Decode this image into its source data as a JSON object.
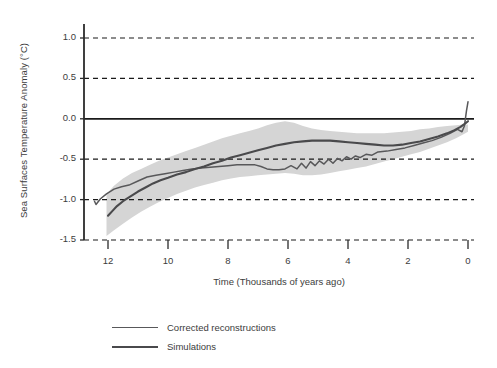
{
  "chart_data": {
    "type": "line",
    "title": "",
    "xlabel": "Time (Thousands of years ago)",
    "ylabel": "Sea Surfaces Temperature Anomaly (°C)",
    "xlim": [
      12.8,
      -0.2
    ],
    "ylim": [
      -1.5,
      1.0
    ],
    "x_reversed": true,
    "grid": "horizontal-dashed",
    "zero_line": true,
    "legend_position": "below-plot-left",
    "xticks": [
      12,
      10,
      8,
      6,
      4,
      2,
      0
    ],
    "xtick_labels": [
      "12",
      "10",
      "8",
      "6",
      "4",
      "2",
      "0"
    ],
    "yticks": [
      1.0,
      0.5,
      0.0,
      -0.5,
      -1.0,
      -1.5
    ],
    "ytick_labels": [
      "1.0",
      "0.5",
      "0.0",
      "-0.5",
      "-1.0",
      "-1.5"
    ],
    "colors": {
      "reconstructions_line": "#58585a",
      "simulations_line": "#4a4a4c",
      "uncertainty_band": "#d5d5d5",
      "axis": "#2b2b2b",
      "grid": "#1a1a1a",
      "background": "#ffffff"
    },
    "series": [
      {
        "name": "Corrected reconstructions",
        "style": "solid",
        "x": [
          12.45,
          12.4,
          12.25,
          12.05,
          11.8,
          11.55,
          11.3,
          11.0,
          10.7,
          10.4,
          10.1,
          9.8,
          9.5,
          9.2,
          8.9,
          8.6,
          8.3,
          8.0,
          7.7,
          7.4,
          7.1,
          6.9,
          6.7,
          6.5,
          6.3,
          6.1,
          5.9,
          5.7,
          5.55,
          5.4,
          5.25,
          5.1,
          4.95,
          4.8,
          4.65,
          4.5,
          4.35,
          4.2,
          4.05,
          3.9,
          3.75,
          3.6,
          3.4,
          3.2,
          3.0,
          2.7,
          2.4,
          2.1,
          1.8,
          1.5,
          1.2,
          0.9,
          0.6,
          0.35,
          0.2,
          0.12,
          0.05,
          0.0
        ],
        "y": [
          -1.02,
          -1.06,
          -0.99,
          -0.93,
          -0.87,
          -0.84,
          -0.82,
          -0.77,
          -0.72,
          -0.7,
          -0.68,
          -0.66,
          -0.64,
          -0.62,
          -0.61,
          -0.6,
          -0.59,
          -0.58,
          -0.57,
          -0.57,
          -0.57,
          -0.59,
          -0.62,
          -0.63,
          -0.63,
          -0.62,
          -0.58,
          -0.62,
          -0.55,
          -0.61,
          -0.53,
          -0.58,
          -0.52,
          -0.56,
          -0.5,
          -0.55,
          -0.49,
          -0.52,
          -0.47,
          -0.5,
          -0.46,
          -0.48,
          -0.44,
          -0.45,
          -0.41,
          -0.4,
          -0.38,
          -0.36,
          -0.33,
          -0.3,
          -0.27,
          -0.23,
          -0.18,
          -0.13,
          -0.16,
          -0.09,
          0.1,
          0.21
        ]
      },
      {
        "name": "Simulations",
        "style": "solid",
        "x": [
          12.0,
          11.85,
          11.7,
          11.5,
          11.25,
          11.0,
          10.75,
          10.5,
          10.25,
          10.0,
          9.7,
          9.4,
          9.1,
          8.8,
          8.5,
          8.2,
          7.9,
          7.6,
          7.3,
          7.0,
          6.7,
          6.4,
          6.1,
          5.8,
          5.5,
          5.2,
          4.9,
          4.6,
          4.3,
          4.0,
          3.7,
          3.4,
          3.1,
          2.8,
          2.5,
          2.2,
          1.9,
          1.6,
          1.3,
          1.0,
          0.7,
          0.45,
          0.25,
          0.1,
          0.0
        ],
        "y": [
          -1.2,
          -1.14,
          -1.08,
          -1.02,
          -0.96,
          -0.9,
          -0.85,
          -0.8,
          -0.76,
          -0.73,
          -0.69,
          -0.66,
          -0.62,
          -0.59,
          -0.55,
          -0.52,
          -0.48,
          -0.45,
          -0.42,
          -0.39,
          -0.36,
          -0.33,
          -0.31,
          -0.29,
          -0.28,
          -0.27,
          -0.27,
          -0.27,
          -0.28,
          -0.29,
          -0.3,
          -0.31,
          -0.32,
          -0.33,
          -0.33,
          -0.32,
          -0.3,
          -0.28,
          -0.25,
          -0.22,
          -0.18,
          -0.14,
          -0.1,
          -0.06,
          -0.03
        ]
      }
    ],
    "uncertainty_band": {
      "name": "Reconstruction uncertainty envelope",
      "x": [
        12.05,
        11.8,
        11.5,
        11.2,
        10.9,
        10.6,
        10.3,
        10.0,
        9.7,
        9.4,
        9.1,
        8.8,
        8.5,
        8.2,
        7.9,
        7.6,
        7.3,
        7.0,
        6.7,
        6.4,
        6.1,
        5.8,
        5.5,
        5.2,
        4.9,
        4.6,
        4.3,
        4.0,
        3.7,
        3.4,
        3.1,
        2.8,
        2.5,
        2.2,
        1.9,
        1.6,
        1.3,
        1.0,
        0.7,
        0.4,
        0.15,
        0.0
      ],
      "upper": [
        -0.93,
        -0.83,
        -0.74,
        -0.67,
        -0.62,
        -0.57,
        -0.52,
        -0.48,
        -0.44,
        -0.4,
        -0.36,
        -0.32,
        -0.28,
        -0.24,
        -0.21,
        -0.18,
        -0.15,
        -0.12,
        -0.08,
        -0.05,
        -0.03,
        -0.05,
        -0.09,
        -0.12,
        -0.14,
        -0.15,
        -0.16,
        -0.17,
        -0.18,
        -0.18,
        -0.18,
        -0.18,
        -0.17,
        -0.16,
        -0.15,
        -0.13,
        -0.12,
        -0.1,
        -0.09,
        -0.08,
        -0.07,
        -0.07
      ],
      "lower": [
        -1.45,
        -1.38,
        -1.3,
        -1.22,
        -1.15,
        -1.09,
        -1.03,
        -0.98,
        -0.93,
        -0.89,
        -0.85,
        -0.82,
        -0.79,
        -0.76,
        -0.74,
        -0.72,
        -0.71,
        -0.7,
        -0.69,
        -0.68,
        -0.67,
        -0.68,
        -0.7,
        -0.7,
        -0.69,
        -0.67,
        -0.65,
        -0.63,
        -0.61,
        -0.59,
        -0.56,
        -0.53,
        -0.5,
        -0.47,
        -0.44,
        -0.41,
        -0.37,
        -0.33,
        -0.29,
        -0.24,
        -0.19,
        -0.16
      ]
    },
    "annotations": []
  },
  "legend": {
    "items": [
      {
        "label": "Corrected reconstructions"
      },
      {
        "label": "Simulations"
      }
    ]
  }
}
